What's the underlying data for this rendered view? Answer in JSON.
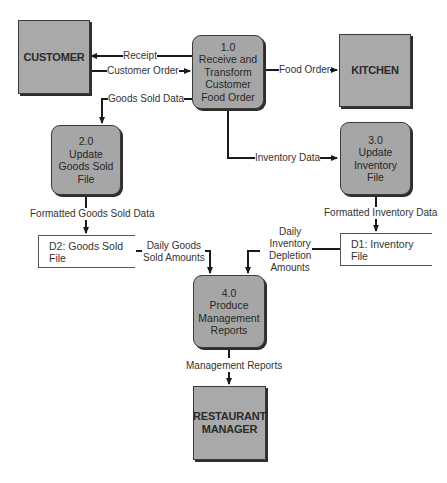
{
  "diagram": {
    "type": "data-flow-diagram",
    "entities": [
      {
        "id": "customer",
        "label": "CUSTOMER"
      },
      {
        "id": "kitchen",
        "label": "KITCHEN"
      },
      {
        "id": "manager",
        "label": "RESTAURANT MANAGER",
        "lines": [
          "RESTAURANT",
          "MANAGER"
        ]
      }
    ],
    "processes": [
      {
        "id": "p1",
        "number": "1.0",
        "lines": [
          "Receive and",
          "Transform",
          "Customer",
          "Food Order"
        ]
      },
      {
        "id": "p2",
        "number": "2.0",
        "lines": [
          "Update",
          "Goods Sold",
          "File"
        ]
      },
      {
        "id": "p3",
        "number": "3.0",
        "lines": [
          "Update",
          "Inventory",
          "File"
        ]
      },
      {
        "id": "p4",
        "number": "4.0",
        "lines": [
          "Produce",
          "Management",
          "Reports"
        ]
      }
    ],
    "stores": [
      {
        "id": "d2",
        "label": "D2: Goods Sold File"
      },
      {
        "id": "d1",
        "label": "D1: Inventory File"
      }
    ],
    "flows": [
      {
        "id": "receipt",
        "label": "Receipt",
        "from": "p1",
        "to": "customer"
      },
      {
        "id": "customer_order",
        "label": "Customer Order",
        "from": "customer",
        "to": "p1"
      },
      {
        "id": "food_order",
        "label": "Food Order",
        "from": "p1",
        "to": "kitchen"
      },
      {
        "id": "goods_sold_data",
        "label": "Goods Sold Data",
        "from": "p1",
        "to": "p2"
      },
      {
        "id": "inventory_data",
        "label": "Inventory Data",
        "from": "p1",
        "to": "p3"
      },
      {
        "id": "formatted_goods",
        "label": "Formatted Goods Sold Data",
        "from": "p2",
        "to": "d2"
      },
      {
        "id": "formatted_inventory",
        "label": "Formatted Inventory Data",
        "from": "p3",
        "to": "d1"
      },
      {
        "id": "daily_goods",
        "label": "Daily Goods Sold Amounts",
        "lines": [
          "Daily Goods",
          "Sold Amounts"
        ],
        "from": "d2",
        "to": "p4"
      },
      {
        "id": "daily_inventory",
        "label": "Daily Inventory Depletion Amounts",
        "lines": [
          "Daily",
          "Inventory",
          "Depletion",
          "Amounts"
        ],
        "from": "d1",
        "to": "p4"
      },
      {
        "id": "mgmt_reports",
        "label": "Management Reports",
        "from": "p4",
        "to": "manager"
      }
    ],
    "colors": {
      "entity_fill": "#a9a9a9",
      "process_fill": "#a6a6a6",
      "line": "#1a1a1a",
      "background": "#ffffff"
    }
  }
}
